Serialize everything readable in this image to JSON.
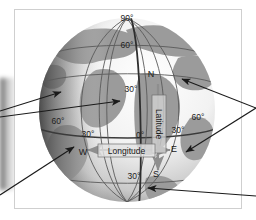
{
  "figure": {
    "kind": "globe-graticule-diagram",
    "title_visible": false,
    "background_color": "#ffffff",
    "frame_color": "#cfcfcf",
    "land_color": "#9a9a9a",
    "ocean_color": "#eeeeee",
    "graticule_color": "#5a5a5a",
    "highlight_line_color": "#3a3a3a",
    "pointer_color": "#1a1a1a"
  },
  "globe": {
    "center_x": 127,
    "center_y": 110,
    "radius_x": 88,
    "radius_y": 92
  },
  "latitude_labels": [
    {
      "id": "lat-90n",
      "text": "90°",
      "x": 127,
      "y": 21
    },
    {
      "id": "lat-60n",
      "text": "60°",
      "x": 127,
      "y": 48
    },
    {
      "id": "lat-30n",
      "text": "30°",
      "x": 131,
      "y": 92
    },
    {
      "id": "lat-0",
      "text": "0°",
      "x": 140,
      "y": 138
    },
    {
      "id": "lat-30s",
      "text": "30°",
      "x": 134,
      "y": 179
    }
  ],
  "longitude_labels": [
    {
      "id": "lon-60w",
      "text": "60°",
      "x": 58,
      "y": 124
    },
    {
      "id": "lon-30w",
      "text": "30°",
      "x": 88,
      "y": 137
    },
    {
      "id": "lon-30e",
      "text": "30°",
      "x": 178,
      "y": 133
    },
    {
      "id": "lon-60e",
      "text": "60°",
      "x": 198,
      "y": 120
    }
  ],
  "cardinal_markers": [
    {
      "id": "cardinal-n",
      "text": "N",
      "x": 151,
      "y": 77
    },
    {
      "id": "cardinal-s",
      "text": "S",
      "x": 156,
      "y": 177
    },
    {
      "id": "cardinal-w",
      "text": "W",
      "x": 83,
      "y": 155
    },
    {
      "id": "cardinal-e",
      "text": "E",
      "x": 174,
      "y": 152
    }
  ],
  "axis_labels": {
    "latitude": {
      "text": "Latitude",
      "orientation": "vertical",
      "x": 159,
      "y": 125
    },
    "longitude": {
      "text": "Longitude",
      "orientation": "horizontal",
      "x": 126,
      "y": 151
    }
  },
  "pointers": [
    {
      "id": "pointer-left-upper",
      "from_x": 0,
      "from_y": 111,
      "to_x": 61,
      "to_y": 92
    },
    {
      "id": "pointer-left-middle",
      "from_x": 0,
      "from_y": 117,
      "to_x": 120,
      "to_y": 101
    },
    {
      "id": "pointer-left-lower",
      "from_x": 0,
      "from_y": 195,
      "to_x": 74,
      "to_y": 147
    },
    {
      "id": "pointer-right-upper",
      "from_x": 256,
      "from_y": 108,
      "to_x": 182,
      "to_y": 79
    },
    {
      "id": "pointer-right-lower",
      "from_x": 256,
      "from_y": 108,
      "to_x": 186,
      "to_y": 152
    },
    {
      "id": "pointer-right-bottom",
      "from_x": 256,
      "from_y": 196,
      "to_x": 148,
      "to_y": 188
    }
  ]
}
